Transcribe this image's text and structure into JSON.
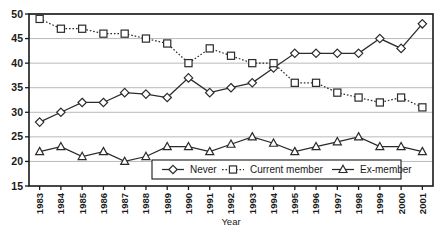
{
  "chart_data": {
    "type": "line",
    "title": "",
    "xlabel": "Year",
    "ylabel": "",
    "grid": true,
    "legend_position": "inside-bottom-center",
    "xlim": [
      1983,
      2001
    ],
    "ylim": [
      15,
      50
    ],
    "ytick_step": 5,
    "yticks": [
      15,
      20,
      25,
      30,
      35,
      40,
      45,
      50
    ],
    "categories": [
      1983,
      1984,
      1985,
      1986,
      1987,
      1988,
      1989,
      1990,
      1991,
      1992,
      1993,
      1994,
      1995,
      1996,
      1997,
      1998,
      1999,
      2000,
      2001
    ],
    "xtick_labels": [
      "1983",
      "1984",
      "1985",
      "1986",
      "1987",
      "1988",
      "1989",
      "1990",
      "1991",
      "1992",
      "1993",
      "1994",
      "1995",
      "1996",
      "1997",
      "1998",
      "1999",
      "2000",
      "2001"
    ],
    "series": [
      {
        "name": "Never",
        "marker": "diamond",
        "line_style": "solid",
        "values": [
          28,
          30,
          32,
          32,
          34,
          33.7,
          33,
          37,
          34,
          35,
          36,
          39,
          42,
          42,
          42,
          42,
          45,
          43,
          48
        ]
      },
      {
        "name": "Current member",
        "marker": "square",
        "line_style": "dotted",
        "values": [
          49,
          47,
          47,
          46,
          46,
          45,
          44,
          40,
          43,
          41.5,
          40,
          40,
          36,
          36,
          34,
          33,
          32,
          33,
          31
        ]
      },
      {
        "name": "Ex-member",
        "marker": "triangle",
        "line_style": "solid",
        "values": [
          22,
          23,
          21,
          22,
          20,
          21,
          23,
          23,
          22,
          23.5,
          25,
          23.7,
          22,
          23,
          24,
          25,
          23,
          23,
          22
        ]
      }
    ]
  },
  "legend": {
    "items": [
      {
        "label": "Never"
      },
      {
        "label": "Current member"
      },
      {
        "label": "Ex-member"
      }
    ]
  },
  "axis": {
    "x_title": "Year"
  }
}
